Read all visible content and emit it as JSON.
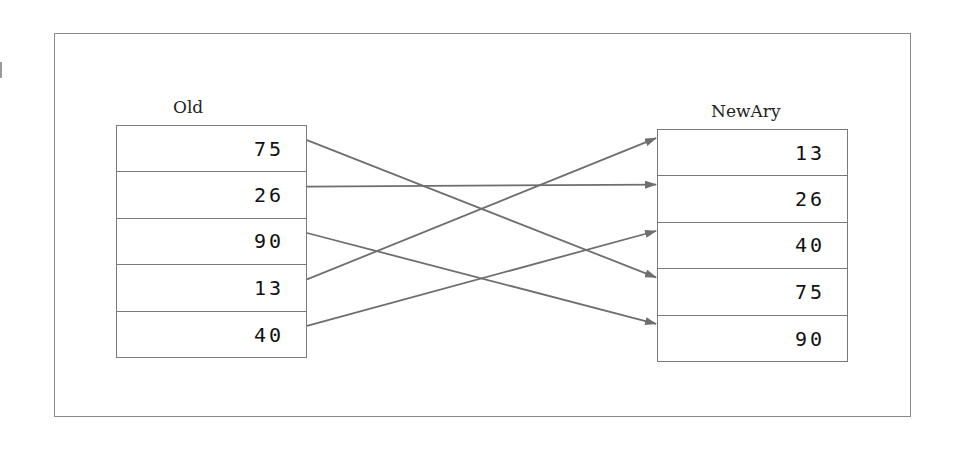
{
  "diagram": {
    "left_array": {
      "label": "Old",
      "values": [
        "75",
        "26",
        "90",
        "13",
        "40"
      ]
    },
    "right_array": {
      "label": "NewAry",
      "values": [
        "13",
        "26",
        "40",
        "75",
        "90"
      ]
    },
    "mappings": [
      {
        "from_index": 0,
        "to_index": 3,
        "value": "75"
      },
      {
        "from_index": 1,
        "to_index": 1,
        "value": "26"
      },
      {
        "from_index": 2,
        "to_index": 4,
        "value": "90"
      },
      {
        "from_index": 3,
        "to_index": 0,
        "value": "13"
      },
      {
        "from_index": 4,
        "to_index": 2,
        "value": "40"
      }
    ],
    "colors": {
      "line": "#6e6e6e",
      "frame": "#8a8a8a",
      "text": "#111111"
    }
  }
}
